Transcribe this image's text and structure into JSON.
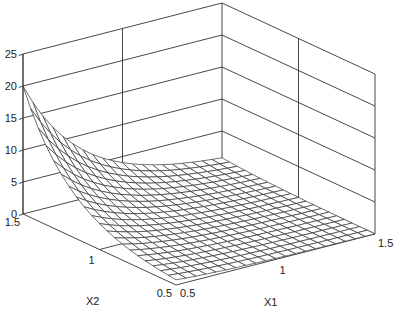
{
  "chart_data": {
    "type": "surface",
    "title": "",
    "xlabel": "X1",
    "ylabel": "X2",
    "zlabel": "",
    "x1_range": [
      0.5,
      1.5
    ],
    "x2_range": [
      0.5,
      1.5
    ],
    "z_range": [
      0,
      25
    ],
    "x1_ticks": [
      "0.5",
      "1",
      "1.5"
    ],
    "x2_ticks": [
      "0.5",
      "1",
      "1.5"
    ],
    "z_ticks": [
      "0",
      "5",
      "10",
      "15",
      "20",
      "25"
    ],
    "z_tick_values": [
      0,
      5,
      10,
      15,
      20,
      25
    ],
    "grid": true,
    "mesh_lines": 21,
    "surface_note": "z[i][j] = profile[i+j], i = steps from X1=0.5, j = steps from X2=1.5 (step 0.05)",
    "profile": [
      20.0,
      17.04,
      14.52,
      12.37,
      10.54,
      8.99,
      7.66,
      6.52,
      5.56,
      4.74,
      4.04,
      3.44,
      2.93,
      2.5,
      2.13,
      1.81,
      1.55,
      1.32,
      1.12,
      0.96,
      0.82,
      0.7,
      0.59,
      0.51,
      0.43,
      0.37,
      0.31,
      0.27,
      0.23,
      0.19,
      0.17,
      0.14,
      0.12,
      0.1,
      0.09,
      0.07,
      0.06,
      0.05,
      0.05,
      0.04,
      0.03
    ],
    "peak": {
      "x1": 0.5,
      "x2": 1.5,
      "z": 20
    }
  },
  "colors": {
    "line": "#333333",
    "surface_fill": "#ffffff",
    "background": "#ffffff"
  },
  "geometry": {
    "origin_front": [
      176,
      285
    ],
    "corner_left": [
      23,
      214
    ],
    "corner_right": [
      375,
      234
    ],
    "corner_back": [
      222,
      163
    ],
    "z_pixels_per_unit": 6.4
  }
}
